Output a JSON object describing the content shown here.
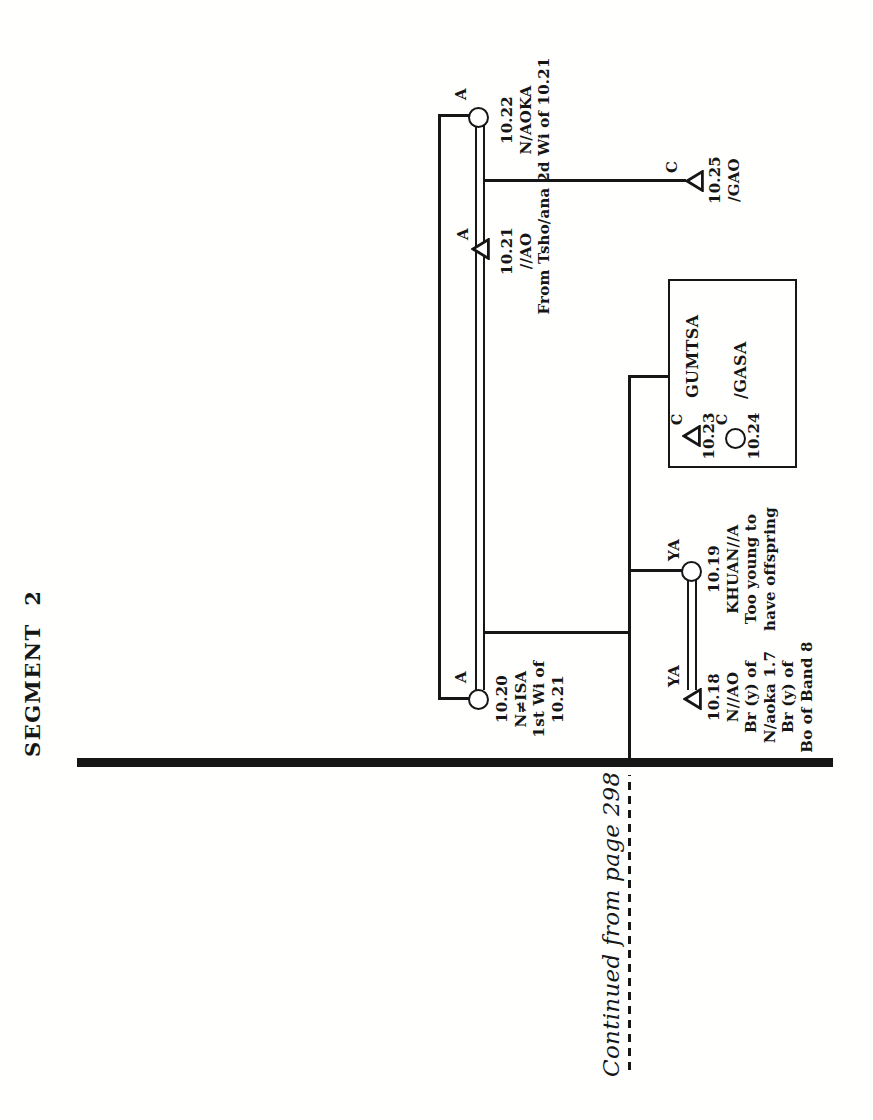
{
  "page": {
    "header": "SEGMENT  2",
    "continued_note": "Continued from page 298"
  },
  "colors": {
    "ink": "#161616",
    "paper": "#ffffff"
  },
  "individuals": [
    {
      "id": "10.18",
      "generation": "YA",
      "symbol": "triangle",
      "lines": [
        "10.18",
        "N//AO",
        "Br (y) of",
        "N/aoka 1.7",
        "Br (y) of",
        "Bo of Band 8"
      ]
    },
    {
      "id": "10.19",
      "generation": "YA",
      "symbol": "circle",
      "lines": [
        "10.19",
        "KHUAN//A",
        "Too young to",
        "have offspring"
      ]
    },
    {
      "id": "10.20",
      "generation": "A",
      "symbol": "circle",
      "lines": [
        "10.20",
        "N≠ISA",
        "1st Wi of",
        "10.21"
      ]
    },
    {
      "id": "10.21",
      "generation": "A",
      "symbol": "triangle",
      "lines": [
        "10.21",
        "//AO",
        "From Tsho/ana"
      ]
    },
    {
      "id": "10.22",
      "generation": "A",
      "symbol": "circle",
      "lines": [
        "10.22",
        "N/AOKA",
        "2d Wi of 10.21"
      ]
    },
    {
      "id": "10.23",
      "generation": "C",
      "symbol": "triangle",
      "number": "10.23",
      "name": "GUMTSA"
    },
    {
      "id": "10.24",
      "generation": "C",
      "symbol": "circle",
      "number": "10.24",
      "name": "/GASA"
    },
    {
      "id": "10.25",
      "generation": "C",
      "symbol": "triangle",
      "lines": [
        "10.25",
        "/GAO"
      ]
    }
  ]
}
